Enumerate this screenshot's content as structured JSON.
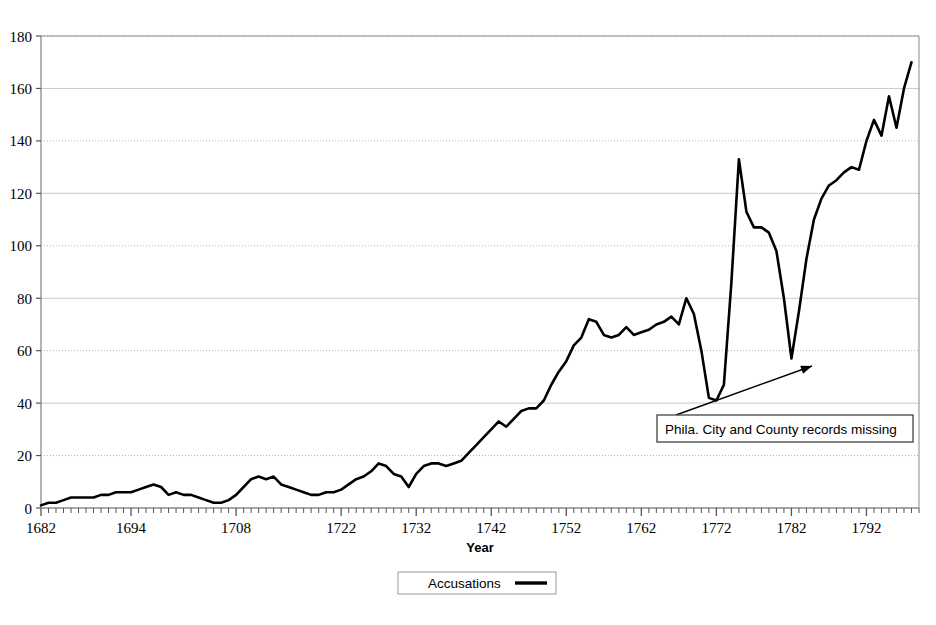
{
  "chart_data": {
    "type": "line",
    "title": "",
    "xlabel": "Year",
    "ylabel": "",
    "xlim": [
      1682,
      1799
    ],
    "ylim": [
      0,
      180
    ],
    "ytick_step": 20,
    "yticks": [
      0,
      20,
      40,
      60,
      80,
      100,
      120,
      140,
      160,
      180
    ],
    "xticks": [
      1682,
      1694,
      1708,
      1722,
      1732,
      1742,
      1752,
      1762,
      1772,
      1782,
      1792
    ],
    "grid": "horizontal",
    "legend_position": "bottom",
    "series": [
      {
        "name": "Accusations",
        "color": "#000000",
        "x": [
          1682,
          1683,
          1684,
          1685,
          1686,
          1687,
          1688,
          1689,
          1690,
          1691,
          1692,
          1693,
          1694,
          1695,
          1696,
          1697,
          1698,
          1699,
          1700,
          1701,
          1702,
          1703,
          1704,
          1705,
          1706,
          1707,
          1708,
          1709,
          1710,
          1711,
          1712,
          1713,
          1714,
          1715,
          1716,
          1717,
          1718,
          1719,
          1720,
          1721,
          1722,
          1723,
          1724,
          1725,
          1726,
          1727,
          1728,
          1729,
          1730,
          1731,
          1732,
          1733,
          1734,
          1735,
          1736,
          1737,
          1738,
          1739,
          1740,
          1741,
          1742,
          1743,
          1744,
          1745,
          1746,
          1747,
          1748,
          1749,
          1750,
          1751,
          1752,
          1753,
          1754,
          1755,
          1756,
          1757,
          1758,
          1759,
          1760,
          1761,
          1762,
          1763,
          1764,
          1765,
          1766,
          1767,
          1768,
          1769,
          1770,
          1771,
          1772,
          1773,
          1774,
          1775,
          1776,
          1777,
          1778,
          1779,
          1780,
          1781,
          1782,
          1783,
          1784,
          1785,
          1786,
          1787,
          1788,
          1789,
          1790,
          1791,
          1792,
          1793,
          1794,
          1795,
          1796,
          1797,
          1798
        ],
        "values": [
          1,
          2,
          2,
          3,
          4,
          4,
          4,
          4,
          5,
          5,
          6,
          6,
          6,
          7,
          8,
          9,
          8,
          5,
          6,
          5,
          5,
          4,
          3,
          2,
          2,
          3,
          5,
          8,
          11,
          12,
          11,
          12,
          9,
          8,
          7,
          6,
          5,
          5,
          6,
          6,
          7,
          9,
          11,
          12,
          14,
          17,
          16,
          13,
          12,
          8,
          13,
          16,
          17,
          17,
          16,
          17,
          18,
          21,
          24,
          27,
          30,
          33,
          31,
          34,
          37,
          38,
          38,
          41,
          47,
          52,
          56,
          62,
          65,
          72,
          71,
          66,
          65,
          66,
          69,
          66,
          67,
          68,
          70,
          71,
          73,
          70,
          80,
          74,
          60,
          42,
          41,
          47,
          86,
          133,
          113,
          107,
          107,
          105,
          98,
          80,
          57,
          75,
          95,
          110,
          118,
          123,
          125,
          128,
          130,
          129,
          140,
          148,
          142,
          157,
          145,
          160,
          170
        ]
      }
    ],
    "annotations": [
      {
        "name": "records-missing-note",
        "text": "Phila. City and County records missing",
        "box": {
          "x": 657,
          "y": 415,
          "w": 256,
          "h": 27
        },
        "arrow": {
          "from_x": 676,
          "from_y": 415,
          "to_x": 812,
          "to_y": 366
        }
      }
    ]
  },
  "axes": {
    "y_tick_labels": [
      "180",
      "160",
      "140",
      "120",
      "100",
      "80",
      "60",
      "40",
      "20",
      "0"
    ],
    "x_tick_labels": [
      "1682",
      "1694",
      "1708",
      "1722",
      "1732",
      "1742",
      "1752",
      "1762",
      "1772",
      "1782",
      "1792"
    ],
    "x_axis_title": "Year"
  },
  "legend": {
    "entries": [
      {
        "label": "Accusations",
        "color": "#000000",
        "marker": "line"
      }
    ]
  },
  "style": {
    "plot_background": "#ffffff",
    "axis_color": "#808080",
    "gridline_solid_color": "#c8c8c8",
    "gridline_dotted_color": "#b4b4b4",
    "series_color": "#000000",
    "annotation_border": "#444444"
  }
}
